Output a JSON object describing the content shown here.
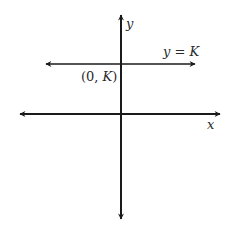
{
  "diagram": {
    "type": "coordinate-plane",
    "labels": {
      "y_axis": "y",
      "x_axis": "x",
      "line_equation": "y = K",
      "intercept_point": "(0, K)"
    },
    "line_equation_parts": {
      "var": "y",
      "eq": " = ",
      "const": "K"
    },
    "intercept_parts": {
      "open": "(0, ",
      "const": "K",
      "close": ")"
    },
    "colors": {
      "stroke": "#1a1a1a",
      "text": "#2a2a2a",
      "background": "#ffffff"
    }
  }
}
